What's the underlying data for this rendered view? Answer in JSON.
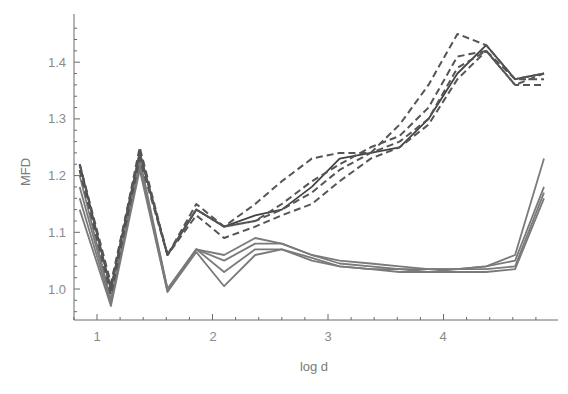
{
  "chart_data": {
    "type": "line",
    "title": "",
    "xlabel": "log d",
    "ylabel": "MFD",
    "xlim": [
      0.8,
      4.93
    ],
    "ylim": [
      0.945,
      1.47
    ],
    "grid": false,
    "legend": null,
    "x_ticks": [
      1,
      2,
      3,
      4
    ],
    "x_tick_labels": [
      "1",
      "2",
      "3",
      "4"
    ],
    "y_ticks": [
      1.0,
      1.1,
      1.2,
      1.3,
      1.4
    ],
    "y_tick_labels": [
      "1.0",
      "1.1",
      "1.2",
      "1.3",
      "1.4"
    ],
    "x": [
      0.85,
      1.12,
      1.37,
      1.61,
      1.86,
      2.1,
      2.37,
      2.6,
      2.86,
      3.1,
      3.37,
      3.62,
      3.87,
      4.12,
      4.37,
      4.62,
      4.87
    ],
    "series": [
      {
        "name": "dashed-1",
        "style": "dashed",
        "color": "#555555",
        "values": [
          1.22,
          1.01,
          1.24,
          1.06,
          1.15,
          1.11,
          1.15,
          1.19,
          1.23,
          1.24,
          1.24,
          1.29,
          1.36,
          1.45,
          1.43,
          1.37,
          1.38
        ]
      },
      {
        "name": "dashed-2",
        "style": "dashed",
        "color": "#555555",
        "values": [
          1.22,
          1.0,
          1.25,
          1.06,
          1.14,
          1.11,
          1.12,
          1.15,
          1.19,
          1.22,
          1.25,
          1.27,
          1.32,
          1.41,
          1.42,
          1.36,
          1.38
        ]
      },
      {
        "name": "dashed-3",
        "style": "dashed",
        "color": "#555555",
        "values": [
          1.21,
          1.0,
          1.24,
          1.06,
          1.14,
          1.11,
          1.12,
          1.14,
          1.17,
          1.21,
          1.24,
          1.26,
          1.3,
          1.39,
          1.42,
          1.37,
          1.37
        ]
      },
      {
        "name": "dashed-4",
        "style": "dashed",
        "color": "#555555",
        "values": [
          1.21,
          0.99,
          1.23,
          1.06,
          1.13,
          1.09,
          1.11,
          1.13,
          1.15,
          1.19,
          1.23,
          1.25,
          1.29,
          1.37,
          1.42,
          1.36,
          1.36
        ]
      },
      {
        "name": "solid-dark",
        "style": "solid",
        "color": "#444444",
        "values": [
          1.22,
          1.0,
          1.24,
          1.06,
          1.14,
          1.11,
          1.13,
          1.14,
          1.18,
          1.23,
          1.24,
          1.25,
          1.3,
          1.38,
          1.43,
          1.37,
          1.38
        ]
      },
      {
        "name": "solid-1",
        "style": "solid",
        "color": "#7a7a7a",
        "values": [
          1.2,
          0.98,
          1.23,
          1.0,
          1.07,
          1.06,
          1.09,
          1.08,
          1.06,
          1.05,
          1.045,
          1.04,
          1.035,
          1.035,
          1.04,
          1.06,
          1.23
        ]
      },
      {
        "name": "solid-2",
        "style": "solid",
        "color": "#7a7a7a",
        "values": [
          1.18,
          0.98,
          1.22,
          1.0,
          1.07,
          1.05,
          1.08,
          1.08,
          1.06,
          1.045,
          1.04,
          1.035,
          1.035,
          1.035,
          1.04,
          1.05,
          1.18
        ]
      },
      {
        "name": "solid-3",
        "style": "solid",
        "color": "#7a7a7a",
        "values": [
          1.16,
          0.975,
          1.22,
          0.995,
          1.07,
          1.03,
          1.07,
          1.07,
          1.055,
          1.04,
          1.035,
          1.035,
          1.03,
          1.035,
          1.035,
          1.04,
          1.17
        ]
      },
      {
        "name": "solid-4",
        "style": "solid",
        "color": "#7a7a7a",
        "values": [
          1.14,
          0.97,
          1.21,
          0.995,
          1.065,
          1.005,
          1.06,
          1.07,
          1.05,
          1.04,
          1.035,
          1.03,
          1.03,
          1.03,
          1.03,
          1.035,
          1.16
        ]
      }
    ]
  },
  "style": {
    "axis_color": "#6a6a6a",
    "tick_label_color": "#8a8a8a",
    "background": "#ffffff"
  }
}
